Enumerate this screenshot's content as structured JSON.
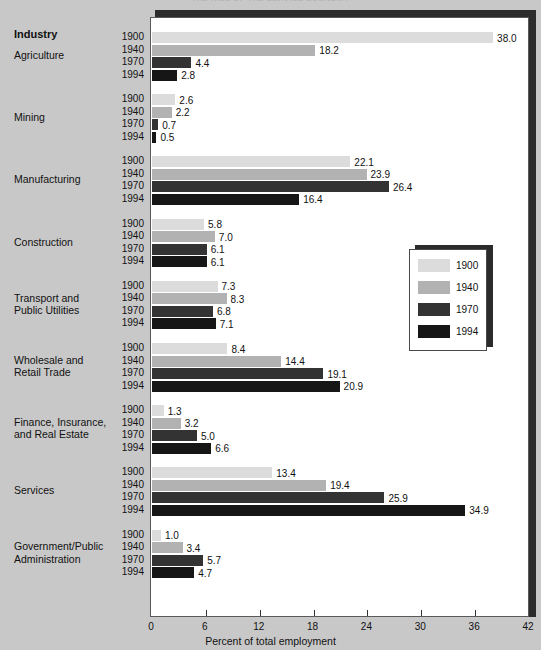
{
  "figure": {
    "cut_title": "THE RISE OF THE SERVICE ECONOMY",
    "industry_header": "Industry",
    "axis_title": "Percent of total employment"
  },
  "chart_data": {
    "type": "bar",
    "orientation": "horizontal",
    "title": "",
    "xlabel": "Percent of total employment",
    "ylabel": "Industry",
    "xlim": [
      0,
      42
    ],
    "xticks": [
      0,
      6,
      12,
      18,
      24,
      30,
      36,
      42
    ],
    "grid": false,
    "legend_position": "right-middle",
    "series_names": [
      "1900",
      "1940",
      "1970",
      "1994"
    ],
    "series_colors": [
      "#dcdcdc",
      "#b2b2b2",
      "#333333",
      "#161616"
    ],
    "categories": [
      "Agriculture",
      "Mining",
      "Manufacturing",
      "Construction",
      "Transport and Public Utilities",
      "Wholesale and Retail Trade",
      "Finance, Insurance, and Real Estate",
      "Services",
      "Government/Public Administration"
    ],
    "category_label_lines": [
      [
        "Agriculture"
      ],
      [
        "Mining"
      ],
      [
        "Manufacturing"
      ],
      [
        "Construction"
      ],
      [
        "Transport and",
        "Public Utilities"
      ],
      [
        "Wholesale and",
        "Retail Trade"
      ],
      [
        "Finance, Insurance,",
        "and Real Estate"
      ],
      [
        "Services"
      ],
      [
        "Government/Public",
        "Administration"
      ]
    ],
    "series": [
      {
        "name": "1900",
        "values": [
          38.0,
          2.6,
          22.1,
          5.8,
          7.3,
          8.4,
          1.3,
          13.4,
          1.0
        ]
      },
      {
        "name": "1940",
        "values": [
          18.2,
          2.2,
          23.9,
          7.0,
          8.3,
          14.4,
          3.2,
          19.4,
          3.4
        ]
      },
      {
        "name": "1970",
        "values": [
          4.4,
          0.7,
          26.4,
          6.1,
          6.8,
          19.1,
          5.0,
          25.9,
          5.7
        ]
      },
      {
        "name": "1994",
        "values": [
          2.8,
          0.5,
          16.4,
          6.1,
          7.1,
          20.9,
          6.6,
          34.9,
          4.7
        ]
      }
    ],
    "data_labels": [
      [
        "38.0",
        "18.2",
        "4.4",
        "2.8"
      ],
      [
        "2.6",
        "2.2",
        "0.7",
        "0.5"
      ],
      [
        "22.1",
        "23.9",
        "26.4",
        "16.4"
      ],
      [
        "5.8",
        "7.0",
        "6.1",
        "6.1"
      ],
      [
        "7.3",
        "8.3",
        "6.8",
        "7.1"
      ],
      [
        "8.4",
        "14.4",
        "19.1",
        "20.9"
      ],
      [
        "1.3",
        "3.2",
        "5.0",
        "6.6"
      ],
      [
        "13.4",
        "19.4",
        "25.9",
        "34.9"
      ],
      [
        "1.0",
        "3.4",
        "5.7",
        "4.7"
      ]
    ]
  },
  "legend": {
    "items": [
      {
        "label": "1900",
        "color": "#dcdcdc"
      },
      {
        "label": "1940",
        "color": "#b2b2b2"
      },
      {
        "label": "1970",
        "color": "#333333"
      },
      {
        "label": "1994",
        "color": "#161616"
      }
    ]
  }
}
